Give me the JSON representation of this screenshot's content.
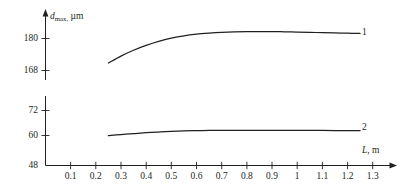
{
  "chart_data": {
    "type": "line",
    "title": "",
    "xlabel": "L, m",
    "ylabel": "d_max, µm",
    "ylabel_parts": {
      "symbol": "d",
      "subscript": "max,",
      "unit": "µm"
    },
    "xlabel_parts": {
      "symbol": "L",
      "unit": "m"
    },
    "x_ticks": [
      "0.1",
      "0.2",
      "0.3",
      "0.4",
      "0.5",
      "0.6",
      "0.7",
      "0.8",
      "0.9",
      "1",
      "1.1",
      "1.2",
      "1.3"
    ],
    "x_tick_values": [
      0.1,
      0.2,
      0.3,
      0.4,
      0.5,
      0.6,
      0.7,
      0.8,
      0.9,
      1.0,
      1.1,
      1.2,
      1.3
    ],
    "xlim": [
      0,
      1.38
    ],
    "y_axis_broken": true,
    "y_ticks_upper": [
      "180",
      "168"
    ],
    "y_tick_values_upper": [
      180,
      168
    ],
    "y_ticks_lower": [
      "72",
      "60",
      "48"
    ],
    "y_tick_values_lower": [
      72,
      60,
      48
    ],
    "grid": false,
    "legend": "inline-right",
    "axis_color": "#231f20",
    "curve_color": "#231f20",
    "series": [
      {
        "name": "1",
        "label": "1",
        "segment": "upper",
        "x": [
          0.25,
          0.3,
          0.35,
          0.4,
          0.45,
          0.5,
          0.55,
          0.6,
          0.65,
          0.7,
          0.75,
          0.8,
          0.85,
          0.9,
          0.95,
          1.0,
          1.05,
          1.1,
          1.15,
          1.2,
          1.25
        ],
        "values": [
          170.8,
          173.4,
          175.6,
          177.4,
          178.9,
          180.1,
          181.0,
          181.6,
          182.0,
          182.3,
          182.5,
          182.6,
          182.6,
          182.6,
          182.5,
          182.4,
          182.3,
          182.2,
          182.1,
          182.0,
          181.9
        ]
      },
      {
        "name": "2",
        "label": "2",
        "segment": "lower",
        "x": [
          0.25,
          0.3,
          0.35,
          0.4,
          0.45,
          0.5,
          0.55,
          0.6,
          0.65,
          0.7,
          0.75,
          0.8,
          0.85,
          0.9,
          0.95,
          1.0,
          1.05,
          1.1,
          1.15,
          1.2,
          1.25
        ],
        "values": [
          61.0,
          61.5,
          61.9,
          62.3,
          62.6,
          62.9,
          63.1,
          63.2,
          63.3,
          63.3,
          63.3,
          63.3,
          63.3,
          63.3,
          63.3,
          63.3,
          63.3,
          63.3,
          63.2,
          63.2,
          63.2
        ]
      }
    ]
  },
  "axis": {
    "y_upper_top_value": 186,
    "y_break_gap": true,
    "arrow_x": true,
    "arrow_y": true
  }
}
